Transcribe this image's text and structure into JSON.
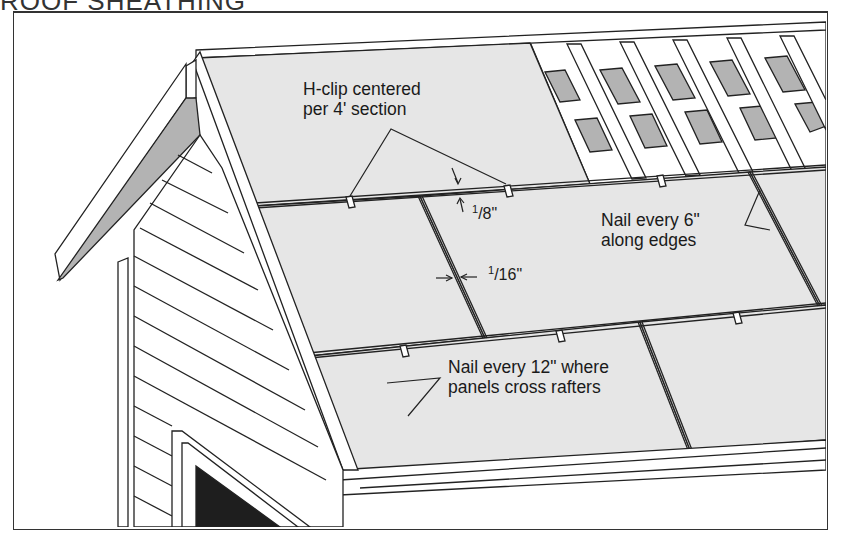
{
  "header": {
    "partial_title": "ROOF SHEATHING"
  },
  "callouts": {
    "hclip": {
      "line1": "H-clip centered",
      "line2": "per 4' section"
    },
    "nail6": {
      "line1": "Nail every 6\"",
      "line2": "along edges"
    },
    "nail12": {
      "line1": "Nail every 12\" where",
      "line2": "panels cross rafters"
    }
  },
  "dimensions": {
    "gap_ends": {
      "num": "1",
      "den": "8",
      "unit": "\""
    },
    "gap_sides": {
      "num": "1",
      "den": "16",
      "unit": "\""
    }
  },
  "colors": {
    "sheathing": "#e6e6e6",
    "line": "#222222",
    "shadow": "#b3b3b3",
    "window": "#1e1e1e",
    "siding": "#ffffff"
  }
}
